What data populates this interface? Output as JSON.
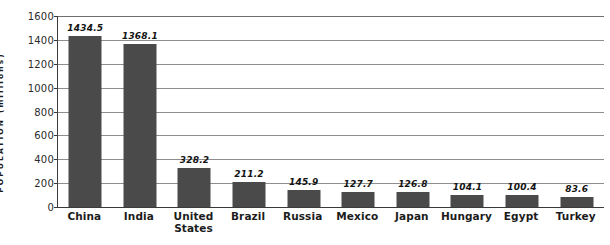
{
  "chart_data": {
    "type": "bar",
    "title": "",
    "subtitle": "",
    "xlabel": "",
    "ylabel": "POPULATION (millions)",
    "ylim": [
      0,
      1600
    ],
    "yticks": [
      0,
      200,
      400,
      600,
      800,
      1000,
      1200,
      1400,
      1600
    ],
    "ytick_labels": [
      "0",
      "200",
      "400",
      "600",
      "800",
      "1000",
      "1200",
      "1400",
      "1600"
    ],
    "grid": true,
    "legend": null,
    "categories": [
      "China",
      "India",
      "United States",
      "Brazil",
      "Russia",
      "Mexico",
      "Japan",
      "Hungary",
      "Egypt",
      "Turkey"
    ],
    "values": [
      1434.5,
      1368.1,
      328.2,
      211.2,
      145.9,
      127.7,
      126.8,
      104.1,
      100.4,
      83.6
    ],
    "value_labels": [
      "1434.5",
      "1368.1",
      "328.2",
      "211.2",
      "145.9",
      "127.7",
      "126.8",
      "104.1",
      "100.4",
      "83.6"
    ],
    "bar_color": "#4a4a4a",
    "axis_color": "#3a3a3a",
    "grid_color": "#8e8e8e",
    "background": "#ffffff"
  }
}
